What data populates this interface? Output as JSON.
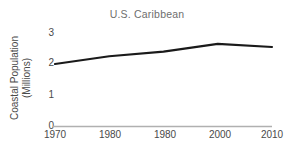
{
  "chart_data": {
    "type": "line",
    "title": "U.S. Caribbean",
    "xlabel": "",
    "ylabel": "Coastal Population (Millions)",
    "ylabel_lines": [
      "Coastal Population",
      "(Millions)"
    ],
    "categories": [
      "1970",
      "1980",
      "1980",
      "2000",
      "2010"
    ],
    "x": [
      1970,
      1980,
      1990,
      2000,
      2010
    ],
    "xtick_labels": [
      "1970",
      "1980",
      "1980",
      "2000",
      "2010"
    ],
    "values": [
      2.0,
      2.25,
      2.4,
      2.65,
      2.55
    ],
    "ytick_labels": [
      "0",
      "1",
      "2",
      "3"
    ],
    "ytick_values": [
      0,
      1,
      2,
      3
    ],
    "xlim": [
      1970,
      2010
    ],
    "ylim": [
      0,
      3
    ],
    "grid": false,
    "legend": false,
    "series": [
      {
        "name": "Coastal Population",
        "values": [
          2.0,
          2.25,
          2.4,
          2.65,
          2.55
        ]
      }
    ],
    "colors": {
      "line": "#1a1a1a",
      "axis": "#b0b0b0",
      "title_text": "#6e6e6e",
      "tick_text": "#4a4a4a",
      "background": "#ffffff"
    }
  }
}
